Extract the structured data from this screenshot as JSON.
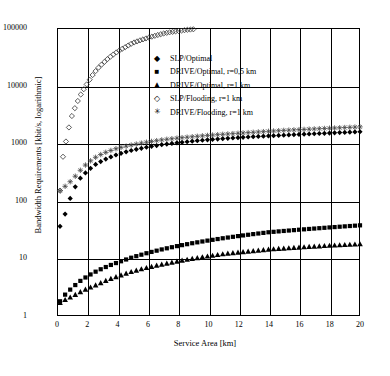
{
  "chart_data": {
    "type": "scatter",
    "title": "",
    "xlabel": "Service Area [km]",
    "ylabel": "Bandwidth Requirements [kbit/s, logarithmic]",
    "xlim": [
      0,
      20
    ],
    "ylim": [
      1,
      100000
    ],
    "yscale": "log",
    "grid": true,
    "legend_position": "upper-center-inside",
    "xticks": [
      "0",
      "2",
      "4",
      "6",
      "8",
      "10",
      "12",
      "14",
      "16",
      "18",
      "20"
    ],
    "yticks": [
      "1",
      "10",
      "100",
      "1000",
      "10000",
      "100000"
    ],
    "series": [
      {
        "name": "SLP/Optimal",
        "marker": "diamond-filled",
        "x": [
          0.2,
          0.5,
          1,
          1.5,
          2,
          2.5,
          3,
          3.5,
          4,
          4.5,
          5,
          6,
          7,
          8,
          9,
          10,
          11,
          12,
          13,
          14,
          15,
          16,
          17,
          18,
          19,
          20
        ],
        "y": [
          36,
          55,
          140,
          240,
          330,
          420,
          500,
          570,
          640,
          700,
          760,
          860,
          950,
          1020,
          1090,
          1150,
          1200,
          1250,
          1300,
          1340,
          1380,
          1420,
          1460,
          1500,
          1540,
          1580
        ]
      },
      {
        "name": "DRIVE/Optimal, r=0,5 km",
        "marker": "square-filled",
        "x": [
          0.2,
          0.5,
          1,
          1.5,
          2,
          2.5,
          3,
          3.5,
          4,
          5,
          6,
          7,
          8,
          9,
          10,
          11,
          12,
          13,
          14,
          15,
          16,
          17,
          18,
          19,
          20
        ],
        "y": [
          1.8,
          2.3,
          3.1,
          4.0,
          4.9,
          5.8,
          6.7,
          7.6,
          8.5,
          10.5,
          12.5,
          14.5,
          16.5,
          18.5,
          20.5,
          22.5,
          24.5,
          26.5,
          28.5,
          30.0,
          31.5,
          33.0,
          34.5,
          36.0,
          37.5
        ]
      },
      {
        "name": "DRIVE/Optimal, r=1 km",
        "marker": "triangle-filled",
        "x": [
          0.2,
          0.5,
          1,
          1.5,
          2,
          2.5,
          3,
          3.5,
          4,
          5,
          6,
          7,
          8,
          9,
          10,
          11,
          12,
          13,
          14,
          15,
          16,
          17,
          18,
          19,
          20
        ],
        "y": [
          1.7,
          1.9,
          2.2,
          2.6,
          3.0,
          3.4,
          3.9,
          4.4,
          4.9,
          6.0,
          7.0,
          8.0,
          9.0,
          10.0,
          11.0,
          12.0,
          12.8,
          13.6,
          14.4,
          15.0,
          15.6,
          16.2,
          16.8,
          17.3,
          17.8
        ]
      },
      {
        "name": "SLP/Flooding, r=1 km",
        "marker": "diamond-open",
        "x": [
          0.2,
          0.4,
          0.6,
          0.9,
          1.2,
          1.5,
          1.8,
          2.1,
          2.4,
          2.7,
          3.0,
          3.4,
          3.8,
          4.2,
          4.6,
          5.0,
          5.4,
          5.8,
          6.2,
          6.6,
          7.0,
          7.4,
          7.8,
          8.2,
          8.6,
          9.0
        ],
        "y": [
          150,
          600,
          1100,
          2600,
          4200,
          6500,
          9000,
          12000,
          16000,
          20000,
          24000,
          30000,
          36000,
          42000,
          48000,
          55000,
          60000,
          65000,
          70000,
          75000,
          80000,
          84000,
          87000,
          90000,
          93000,
          95000
        ]
      },
      {
        "name": "DRIVE/Flooding, r=1 km",
        "marker": "asterisk",
        "x": [
          0.2,
          0.5,
          1,
          1.5,
          2,
          2.5,
          3,
          3.5,
          4,
          4.5,
          5,
          6,
          7,
          8,
          9,
          10,
          11,
          12,
          13,
          14,
          15,
          16,
          17,
          18,
          19,
          20
        ],
        "y": [
          150,
          175,
          230,
          330,
          450,
          560,
          660,
          740,
          820,
          880,
          940,
          1050,
          1150,
          1230,
          1300,
          1370,
          1430,
          1490,
          1550,
          1610,
          1670,
          1720,
          1770,
          1820,
          1870,
          1920
        ]
      }
    ]
  },
  "legend": {
    "items": [
      {
        "marker": "◆",
        "label": "SLP/Optimal"
      },
      {
        "marker": "■",
        "label": "DRIVE/Optimal, r=0,5 km"
      },
      {
        "marker": "▲",
        "label": "DRIVE/Optimal, r=1 km"
      },
      {
        "marker": "◇",
        "label": "SLP/Flooding, r=1 km"
      },
      {
        "marker": "✳",
        "label": "DRIVE/Flooding, r=1 km"
      }
    ]
  }
}
